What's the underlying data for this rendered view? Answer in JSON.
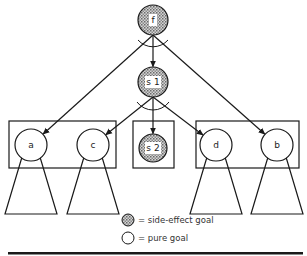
{
  "diagram": {
    "type": "goal-tree",
    "nodes": [
      {
        "id": "f",
        "label": "f",
        "kind": "side-effect"
      },
      {
        "id": "s1",
        "label": "s 1",
        "kind": "side-effect"
      },
      {
        "id": "a",
        "label": "a",
        "kind": "pure"
      },
      {
        "id": "c",
        "label": "c",
        "kind": "pure"
      },
      {
        "id": "s2",
        "label": "s 2",
        "kind": "side-effect"
      },
      {
        "id": "d",
        "label": "d",
        "kind": "pure"
      },
      {
        "id": "b",
        "label": "b",
        "kind": "pure"
      }
    ],
    "edges": [
      {
        "from": "f",
        "to": "s1"
      },
      {
        "from": "f",
        "to": "a"
      },
      {
        "from": "f",
        "to": "b"
      },
      {
        "from": "s1",
        "to": "c"
      },
      {
        "from": "s1",
        "to": "s2"
      },
      {
        "from": "s1",
        "to": "d"
      }
    ],
    "groups": [
      {
        "members": [
          "a",
          "c"
        ]
      },
      {
        "members": [
          "s2"
        ]
      },
      {
        "members": [
          "d",
          "b"
        ]
      }
    ],
    "subtrees_below": [
      "a",
      "c",
      "d",
      "b"
    ]
  },
  "legend": {
    "items": [
      {
        "kind": "side-effect",
        "text": "= side-effect goal"
      },
      {
        "kind": "pure",
        "text": "= pure goal"
      }
    ]
  },
  "colors": {
    "stroke": "#1a1a1a",
    "side_effect_fill": "#a8a8a8",
    "pure_fill": "#ffffff"
  }
}
